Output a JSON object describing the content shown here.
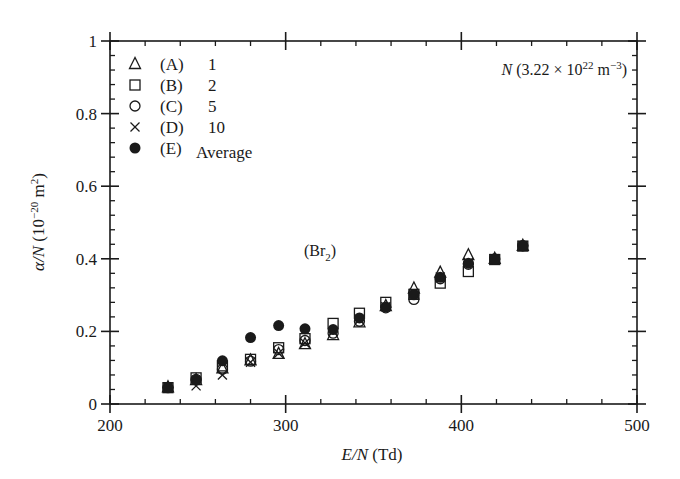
{
  "chart_data": {
    "type": "scatter",
    "title": "",
    "xlabel": "E/N (Td)",
    "ylabel": "α/N (10^-20 m^2)",
    "xlim": [
      200,
      500
    ],
    "ylim": [
      0,
      1
    ],
    "x_ticks": [
      200,
      300,
      400,
      500
    ],
    "x_tick_labels": [
      "200",
      "300",
      "400",
      "500"
    ],
    "x_minor_step": 20,
    "y_ticks": [
      0,
      0.2,
      0.4,
      0.6,
      0.8,
      1
    ],
    "y_tick_labels": [
      "0",
      "0.2",
      "0.4",
      "0.6",
      "0.8",
      "1"
    ],
    "y_minor_step": 0.04,
    "grid": false,
    "legend_position": "upper-left",
    "annotations": [
      {
        "text": "N (3.22 × 10^22 m^-3)",
        "position": "upper-right"
      },
      {
        "text": "(Br2)",
        "x": 325,
        "y": 0.42
      }
    ],
    "series": [
      {
        "name": "(A) 1",
        "label_id": "(A)",
        "label_value": "1",
        "marker": "triangle",
        "x": [
          233,
          249,
          264,
          280,
          296,
          311,
          327,
          342,
          357,
          373,
          388,
          404,
          419,
          435
        ],
        "y": [
          0.046,
          0.066,
          0.098,
          0.12,
          0.138,
          0.165,
          0.19,
          0.225,
          0.27,
          0.318,
          0.362,
          0.41,
          0.4,
          0.436
        ]
      },
      {
        "name": "(B) 2",
        "label_id": "(B)",
        "label_value": "2",
        "marker": "square",
        "x": [
          233,
          249,
          264,
          280,
          296,
          311,
          327,
          342,
          357,
          373,
          388,
          404,
          419,
          435
        ],
        "y": [
          0.045,
          0.072,
          0.105,
          0.123,
          0.155,
          0.18,
          0.222,
          0.25,
          0.28,
          0.302,
          0.333,
          0.365,
          0.398,
          0.435
        ]
      },
      {
        "name": "(C) 5",
        "label_id": "(C)",
        "label_value": "5",
        "marker": "circle",
        "x": [
          233,
          249,
          264,
          280,
          296,
          311,
          327,
          342,
          357,
          373,
          388,
          404,
          419,
          435
        ],
        "y": [
          0.045,
          0.068,
          0.096,
          0.118,
          0.15,
          0.175,
          0.195,
          0.228,
          0.265,
          0.288,
          0.345,
          0.385,
          0.4,
          0.436
        ]
      },
      {
        "name": "(D) 10",
        "label_id": "(D)",
        "label_value": "10",
        "marker": "cross",
        "x": [
          233,
          249,
          264,
          280,
          296,
          311,
          327,
          342,
          357,
          373,
          388,
          404,
          419,
          435
        ],
        "y": [
          0.046,
          0.05,
          0.08,
          0.115,
          0.14,
          0.168,
          0.2,
          0.232,
          0.268,
          0.305,
          0.35,
          0.39,
          0.4,
          0.436
        ]
      },
      {
        "name": "(E) Average",
        "label_id": "(E)",
        "label_value": "Average",
        "marker": "filled-circle",
        "x": [
          233,
          249,
          264,
          280,
          296,
          311,
          327,
          342,
          357,
          373,
          388,
          404,
          419,
          435
        ],
        "y": [
          0.046,
          0.066,
          0.119,
          0.183,
          0.216,
          0.207,
          0.205,
          0.237,
          0.267,
          0.301,
          0.349,
          0.388,
          0.399,
          0.436
        ]
      }
    ]
  },
  "labels": {
    "x_axis_italic": "E/N",
    "x_axis_unit": " (Td)",
    "y_axis_italic": "α/N",
    "y_axis_unit_base": " (10",
    "y_axis_unit_exp": "−20",
    "y_axis_unit_tail": "  m",
    "y_axis_unit_exp2": "2",
    "y_axis_close": ")",
    "density_italic": "N",
    "density_base": " (3.22 × 10",
    "density_exp": "22",
    "density_mid": " m",
    "density_exp2": "−3",
    "density_close": ")",
    "gas_open": "(Br",
    "gas_sub": "2",
    "gas_close": ")"
  },
  "colors": {
    "ink": "#1a1a1a",
    "background": "#ffffff"
  }
}
